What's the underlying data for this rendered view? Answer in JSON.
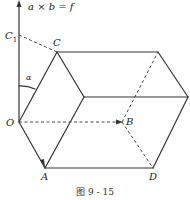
{
  "figure": {
    "caption": "图 9 - 15",
    "axis_label": "a × b = f",
    "vertices": {
      "O": "O",
      "A": "A",
      "B": "B",
      "C": "C",
      "C1": "C",
      "C1_sub": "1",
      "D": "D"
    },
    "angle_label": "α"
  }
}
